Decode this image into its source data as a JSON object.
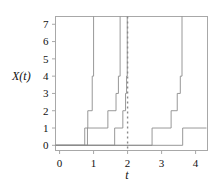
{
  "figure": {
    "background": "#ffffff",
    "line_color": "#8c8c8c",
    "frame_color": "#a8a8a8",
    "marker_color": "#9a9a9a"
  },
  "labels": {
    "ylabel": "X(t)",
    "xlabel": "t"
  },
  "chart_data": {
    "type": "line",
    "title": "",
    "xlabel": "t",
    "ylabel": "X(t)",
    "xlim": [
      -0.12,
      4.35
    ],
    "ylim": [
      -0.3,
      7.45
    ],
    "grid": false,
    "legend": null,
    "step_style": "post",
    "xticks": [
      0,
      1,
      2,
      3,
      4
    ],
    "xtick_labels": [
      "0",
      "1",
      "2",
      "3",
      "4"
    ],
    "yticks": [
      0,
      1,
      2,
      3,
      4,
      5,
      6,
      7
    ],
    "ytick_labels": [
      "0",
      "1",
      "2",
      "3",
      "4",
      "5",
      "6",
      "7"
    ],
    "annotations": [
      {
        "kind": "vertical-dotted-line",
        "x": 2.0,
        "label": "t = 2",
        "color": "#8a8a8a",
        "dash": "2,3"
      }
    ],
    "series": [
      {
        "name": "path-1",
        "x": [
          -0.12,
          0.74,
          0.74,
          0.83,
          0.83,
          0.96,
          0.96,
          1.0,
          1.0
        ],
        "values": [
          0,
          0,
          1,
          1,
          2,
          2,
          4,
          4,
          7.6
        ]
      },
      {
        "name": "path-2",
        "x": [
          -0.12,
          0.82,
          0.82,
          1.42,
          1.42,
          1.66,
          1.66,
          1.73,
          1.73,
          1.78,
          1.78
        ],
        "values": [
          0,
          0,
          1,
          1,
          2,
          2,
          3,
          3,
          4,
          4,
          7.6
        ]
      },
      {
        "name": "path-3",
        "x": [
          -0.12,
          1.62,
          1.62,
          1.86,
          1.86,
          1.94,
          1.94,
          1.97,
          1.97,
          1.99,
          1.99
        ],
        "values": [
          0,
          0,
          1,
          1,
          2,
          2,
          3,
          3,
          4,
          4,
          7.6
        ]
      },
      {
        "name": "path-4",
        "x": [
          -0.12,
          2.72,
          2.72,
          3.28,
          3.28,
          3.46,
          3.46,
          3.55,
          3.55,
          3.6,
          3.6
        ],
        "values": [
          0,
          0,
          1,
          1,
          2,
          2,
          3,
          3,
          4,
          4,
          7.6
        ]
      },
      {
        "name": "path-5",
        "x": [
          -0.12,
          3.62,
          3.62,
          4.32
        ],
        "values": [
          0,
          0,
          1,
          1
        ]
      }
    ]
  }
}
